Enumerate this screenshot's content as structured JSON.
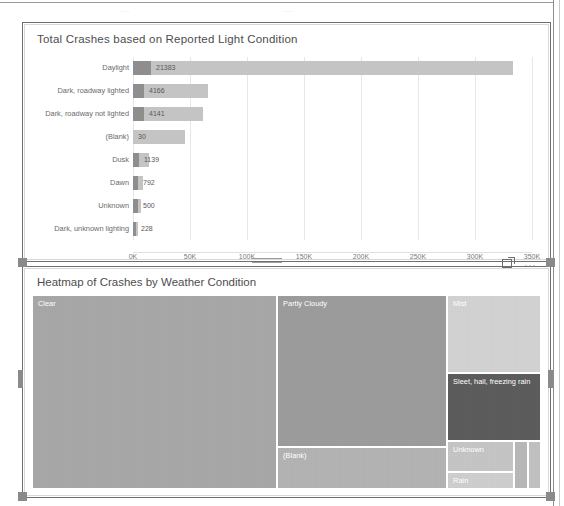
{
  "window": {
    "clipped_top_labels": [
      "....",
      "...."
    ]
  },
  "bar_card": {
    "title": "Total Crashes based on Reported Light Condition",
    "axis_ticks": [
      "0K",
      "50K",
      "100K",
      "150K",
      "200K",
      "250K",
      "300K",
      "350K"
    ]
  },
  "treemap_card": {
    "title": "Heatmap of Crashes by Weather Condition",
    "focus_icon": "focus-mode-icon",
    "more_icon": "…"
  },
  "chart_data": [
    {
      "type": "bar",
      "title": "Total Crashes based on Reported Light Condition",
      "xlabel": "",
      "ylabel": "",
      "orientation": "horizontal",
      "stacked": true,
      "grid": true,
      "xlim": [
        0,
        350000
      ],
      "xticks": [
        0,
        50000,
        100000,
        150000,
        200000,
        250000,
        300000,
        350000
      ],
      "xticklabels": [
        "0K",
        "50K",
        "100K",
        "150K",
        "200K",
        "250K",
        "300K",
        "350K"
      ],
      "categories": [
        "Daylight",
        "Dark, roadway lighted",
        "Dark, roadway not lighted",
        "(Blank)",
        "Dusk",
        "Dawn",
        "Unknown",
        "Dark, unknown lighting"
      ],
      "series": [
        {
          "name": "Labeled value",
          "values": [
            21383,
            4166,
            4141,
            30,
            1139,
            792,
            500,
            228
          ]
        },
        {
          "name": "Total bar extent",
          "values": [
            333000,
            66000,
            61000,
            46000,
            14000,
            9000,
            7000,
            1500
          ]
        }
      ],
      "data_labels": [
        "21383",
        "4166",
        "4141",
        "30",
        "1139",
        "792",
        "500",
        "228"
      ]
    },
    {
      "type": "treemap",
      "title": "Heatmap of Crashes by Weather Condition",
      "tiles": [
        {
          "label": "Clear",
          "color": "#a8a8a8"
        },
        {
          "label": "Partly Cloudy",
          "color": "#9d9d9d"
        },
        {
          "label": "(Blank)",
          "color": "#b4b4b4"
        },
        {
          "label": "Mist",
          "color": "#d3d3d3"
        },
        {
          "label": "Sleet, hail, freezing rain",
          "color": "#5d5d5d"
        },
        {
          "label": "Unknown",
          "color": "#c6c6c6"
        },
        {
          "label": "Rain",
          "color": "#cfcfcf"
        },
        {
          "label": "",
          "color": "#b9b9b9"
        },
        {
          "label": "",
          "color": "#c2c2c2"
        }
      ]
    }
  ]
}
